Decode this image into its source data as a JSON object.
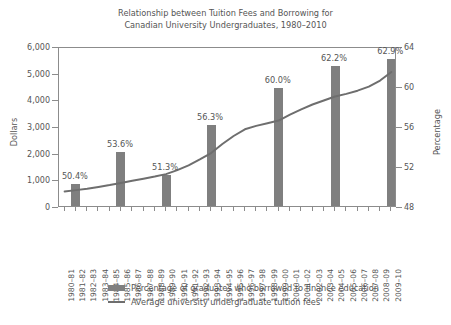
{
  "chart_data": {
    "type": "bar",
    "title": "Relationship between Tuition Fees and Borrowing for Canadian University Undergraduates, 1980–2010",
    "title_line1": "Relationship between Tuition Fees and Borrowing for",
    "title_line2": "Canadian University Undergraduates, 1980–2010",
    "xlabel": "",
    "ylabel": "Dollars",
    "ylabel_right": "Percentage",
    "ylim": [
      0,
      6000
    ],
    "ylim_right": [
      48,
      64
    ],
    "yticks": [
      "0",
      "1,000",
      "2,000",
      "3,000",
      "4,000",
      "5,000",
      "6,000"
    ],
    "ytick_values": [
      0,
      1000,
      2000,
      3000,
      4000,
      5000,
      6000
    ],
    "yticks_right": [
      "48",
      "52",
      "56",
      "60",
      "64"
    ],
    "ytick_values_right": [
      48,
      52,
      56,
      60,
      64
    ],
    "grid": false,
    "legend_position": "bottom",
    "categories": [
      "1980–81",
      "1981–82",
      "1982–83",
      "1983–84",
      "1984–85",
      "1985–86",
      "1986–87",
      "1987–88",
      "1988–89",
      "1989–90",
      "1990–91",
      "1991–92",
      "1992–93",
      "1993–94",
      "1994–95",
      "1995–96",
      "1996–97",
      "1997–98",
      "1998–99",
      "1999–00",
      "2000–01",
      "2001–02",
      "2002–03",
      "2003–04",
      "2004–05",
      "2005–06",
      "2006–07",
      "2007–08",
      "2008–09",
      "2009–10"
    ],
    "series": [
      {
        "name": "Percentage of graduates who borrowed to finance education",
        "type": "bar",
        "axis": "right",
        "unit": "%",
        "color": "#7f7f7f",
        "points": [
          {
            "category": "1981–82",
            "index": 1,
            "value": 50.4,
            "label": "50.4%"
          },
          {
            "category": "1985–86",
            "index": 5,
            "value": 53.6,
            "label": "53.6%"
          },
          {
            "category": "1989–90",
            "index": 9,
            "value": 51.3,
            "label": "51.3%"
          },
          {
            "category": "1993–94",
            "index": 13,
            "value": 56.3,
            "label": "56.3%"
          },
          {
            "category": "1999–00",
            "index": 19,
            "value": 60.0,
            "label": "60.0%"
          },
          {
            "category": "2004–05",
            "index": 24,
            "value": 62.2,
            "label": "62.2%"
          },
          {
            "category": "2009–10",
            "index": 29,
            "value": 62.9,
            "label": "62.9%"
          }
        ]
      },
      {
        "name": "Average university undergraduate tuition fees",
        "type": "line",
        "axis": "left",
        "unit": "$",
        "color": "#6e6e6e",
        "values": [
          620,
          670,
          720,
          790,
          860,
          940,
          1020,
          1100,
          1180,
          1270,
          1420,
          1600,
          1820,
          2060,
          2400,
          2700,
          2950,
          3080,
          3180,
          3280,
          3500,
          3700,
          3880,
          4030,
          4180,
          4280,
          4400,
          4550,
          4780,
          5100
        ]
      }
    ],
    "legend": [
      {
        "label": "Percentage of graduates who borrowed to finance education",
        "marker": "bar"
      },
      {
        "label": "Average university undergraduate tuition fees",
        "marker": "line"
      }
    ]
  }
}
